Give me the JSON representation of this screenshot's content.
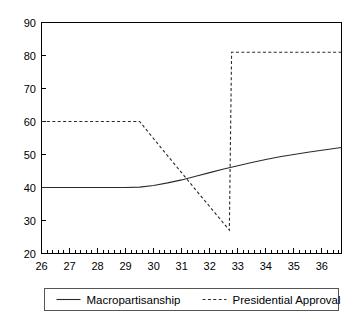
{
  "chart_data": {
    "type": "line",
    "title": "",
    "subtitle": "",
    "xlabel": "",
    "ylabel": "",
    "xlim": [
      26,
      36.7
    ],
    "ylim": [
      20,
      90
    ],
    "grid": false,
    "legend_position": "bottom",
    "y_ticks": [
      20,
      30,
      40,
      50,
      60,
      70,
      80,
      90
    ],
    "y_tick_labels": [
      "20",
      "30",
      "40",
      "50",
      "60",
      "70",
      "80",
      "90"
    ],
    "x_ticks": [
      26,
      27,
      28,
      29,
      30,
      31,
      32,
      33,
      34,
      35,
      36
    ],
    "x_tick_labels": [
      "26",
      "27",
      "28",
      "29",
      "30",
      "31",
      "32",
      "33",
      "34",
      "35",
      "36"
    ],
    "x_minor_ticks_per_interval": 4,
    "series": [
      {
        "name": "Macropartisanship",
        "style": "solid",
        "color": "#2a2a2a",
        "x": [
          26.0,
          27.0,
          28.0,
          29.0,
          29.5,
          30.0,
          30.5,
          31.0,
          31.5,
          32.0,
          32.5,
          33.0,
          33.5,
          34.0,
          34.5,
          35.0,
          35.5,
          36.0,
          36.7
        ],
        "y": [
          40.0,
          40.0,
          40.0,
          40.0,
          40.1,
          40.6,
          41.4,
          42.3,
          43.4,
          44.5,
          45.6,
          46.6,
          47.6,
          48.5,
          49.3,
          50.0,
          50.7,
          51.3,
          52.1
        ]
      },
      {
        "name": "Presidential Approval",
        "style": "dashed",
        "color": "#2a2a2a",
        "x": [
          26.0,
          27.0,
          28.0,
          29.0,
          29.5,
          30.5,
          31.5,
          32.0,
          32.5,
          32.7,
          32.78,
          33.0,
          34.0,
          35.0,
          36.0,
          36.7
        ],
        "y": [
          60.0,
          60.0,
          60.0,
          60.0,
          60.0,
          49.6,
          39.3,
          34.2,
          29.1,
          27.1,
          81.0,
          81.0,
          81.0,
          81.0,
          81.0,
          81.0
        ]
      }
    ]
  },
  "legend": {
    "entries": [
      {
        "label": "Macropartisanship",
        "style": "solid"
      },
      {
        "label": "Presidential Approval",
        "style": "dashed"
      }
    ]
  }
}
